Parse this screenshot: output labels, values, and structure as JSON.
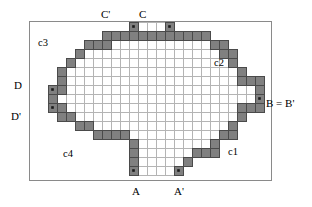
{
  "figure": {
    "frame": {
      "x": 29,
      "y": 21,
      "width": 243,
      "height": 160
    },
    "grid": {
      "origin_x": 30,
      "origin_y": 22,
      "cell": 9.0,
      "cols": 26,
      "rows": 17,
      "line_color": "#b4b4b4",
      "shade_color": "#808080",
      "shade_stroke": "#4a4a4a",
      "background": "#ffffff"
    },
    "colors": {
      "frame_stroke": "#8a8a8a",
      "text": "#000000",
      "marker_dot": "#1a1a1a",
      "shaded_cell": "#808080",
      "grid_line": "#b4b4b4"
    },
    "shaded_cells": [
      [
        11,
        0
      ],
      [
        15,
        0
      ],
      [
        8,
        1
      ],
      [
        9,
        1
      ],
      [
        10,
        1
      ],
      [
        11,
        1
      ],
      [
        12,
        1
      ],
      [
        13,
        1
      ],
      [
        14,
        1
      ],
      [
        15,
        1
      ],
      [
        16,
        1
      ],
      [
        17,
        1
      ],
      [
        18,
        1
      ],
      [
        19,
        1
      ],
      [
        6,
        2
      ],
      [
        7,
        2
      ],
      [
        8,
        2
      ],
      [
        20,
        2
      ],
      [
        21,
        2
      ],
      [
        5,
        3
      ],
      [
        21,
        3
      ],
      [
        22,
        3
      ],
      [
        4,
        4
      ],
      [
        22,
        4
      ],
      [
        3,
        5
      ],
      [
        23,
        5
      ],
      [
        3,
        6
      ],
      [
        23,
        6
      ],
      [
        24,
        6
      ],
      [
        25,
        6
      ],
      [
        2,
        7
      ],
      [
        3,
        7
      ],
      [
        25,
        7
      ],
      [
        2,
        8
      ],
      [
        25,
        8
      ],
      [
        2,
        9
      ],
      [
        3,
        9
      ],
      [
        23,
        9
      ],
      [
        24,
        9
      ],
      [
        25,
        9
      ],
      [
        3,
        10
      ],
      [
        4,
        10
      ],
      [
        23,
        10
      ],
      [
        5,
        11
      ],
      [
        6,
        11
      ],
      [
        22,
        11
      ],
      [
        7,
        12
      ],
      [
        21,
        12
      ],
      [
        22,
        12
      ],
      [
        8,
        12
      ],
      [
        9,
        12
      ],
      [
        10,
        12
      ],
      [
        11,
        13
      ],
      [
        20,
        13
      ],
      [
        11,
        14
      ],
      [
        18,
        14
      ],
      [
        19,
        14
      ],
      [
        20,
        14
      ],
      [
        11,
        15
      ],
      [
        17,
        15
      ],
      [
        11,
        16
      ],
      [
        16,
        16
      ]
    ],
    "marked_points": [
      {
        "id": "C-prime",
        "label": "C'",
        "cell": [
          11,
          0
        ],
        "label_pos": {
          "x": 101,
          "y": 9
        },
        "dot": true
      },
      {
        "id": "C",
        "label": "C",
        "cell": [
          15,
          0
        ],
        "label_pos": {
          "x": 139,
          "y": 9
        },
        "dot": true
      },
      {
        "id": "D",
        "label": "D",
        "cell": [
          2,
          7
        ],
        "label_pos": {
          "x": 14,
          "y": 80
        },
        "dot": true
      },
      {
        "id": "D-prime",
        "label": "D'",
        "cell": [
          2,
          9
        ],
        "label_pos": {
          "x": 11,
          "y": 111
        },
        "dot": true
      },
      {
        "id": "B-equals-B-prime",
        "label": "B = B'",
        "cell": [
          25,
          8
        ],
        "label_pos": {
          "x": 266,
          "y": 98
        },
        "dot": true
      },
      {
        "id": "A",
        "label": "A",
        "cell": [
          11,
          16
        ],
        "label_pos": {
          "x": 132,
          "y": 186
        },
        "dot": true
      },
      {
        "id": "A-prime",
        "label": "A'",
        "cell": [
          16,
          16
        ],
        "label_pos": {
          "x": 174,
          "y": 186
        },
        "dot": true
      }
    ],
    "arc_labels": [
      {
        "id": "c3",
        "text": "c3",
        "x": 38,
        "y": 37
      },
      {
        "id": "c2",
        "text": "c2",
        "x": 214,
        "y": 57
      },
      {
        "id": "c4",
        "text": "c4",
        "x": 63,
        "y": 148
      },
      {
        "id": "c1",
        "text": "c1",
        "x": 228,
        "y": 146
      }
    ]
  }
}
